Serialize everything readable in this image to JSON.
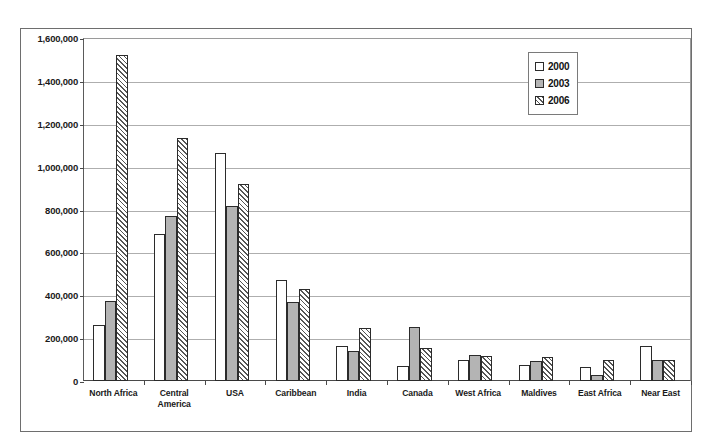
{
  "chart_data": {
    "type": "bar",
    "title": "",
    "xlabel": "",
    "ylabel": "",
    "ylim": [
      0,
      1600000
    ],
    "ytick_values": [
      0,
      200000,
      400000,
      600000,
      800000,
      1000000,
      1200000,
      1400000,
      1600000
    ],
    "ytick_labels": [
      "0",
      "200,000",
      "400,000",
      "600,000",
      "800,000",
      "1,000,000",
      "1,200,000",
      "1,400,000",
      "1,600,000"
    ],
    "grid": true,
    "legend_position": "upper right",
    "categories": [
      "North Africa",
      "Central America",
      "USA",
      "Caribbean",
      "India",
      "Canada",
      "West Africa",
      "Maldives",
      "East Africa",
      "Near East"
    ],
    "series": [
      {
        "name": "2000",
        "style": "white",
        "values": [
          260000,
          685000,
          1065000,
          470000,
          165000,
          70000,
          100000,
          75000,
          65000,
          165000
        ]
      },
      {
        "name": "2003",
        "style": "gray",
        "values": [
          375000,
          770000,
          815000,
          370000,
          140000,
          250000,
          120000,
          95000,
          30000,
          100000
        ]
      },
      {
        "name": "2006",
        "style": "hatched",
        "values": [
          1520000,
          1135000,
          920000,
          430000,
          245000,
          155000,
          115000,
          110000,
          100000,
          100000
        ]
      }
    ]
  },
  "legend": {
    "entries": [
      {
        "label": "2000",
        "swatch": "white-swatch"
      },
      {
        "label": "2003",
        "swatch": "gray-swatch"
      },
      {
        "label": "2006",
        "swatch": "hatched-swatch"
      }
    ]
  },
  "colors": {
    "series_2000": "#ffffff",
    "series_2003": "#b4b4b4",
    "series_2006_hatch": "#555555",
    "bar_outline": "#2b2b2b",
    "gridline": "#aeaeae",
    "axis": "#4a4a4a",
    "frame": "#6e6e6e",
    "text": "#1a1a1a",
    "background": "#ffffff"
  }
}
